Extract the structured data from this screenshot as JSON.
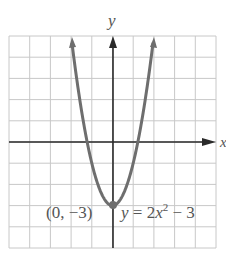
{
  "chart_data": {
    "type": "line",
    "title": "",
    "xlabel": "x",
    "ylabel": "y",
    "xlim": [
      -5,
      5
    ],
    "ylim": [
      -5,
      5
    ],
    "grid": true,
    "grid_step": 1,
    "series": [
      {
        "name": "y = 2x^2 - 3",
        "equation": "y = 2x^2 - 3",
        "x": [
          -2,
          -1.5,
          -1,
          -0.5,
          0,
          0.5,
          1,
          1.5,
          2
        ],
        "y": [
          5,
          1.5,
          -1,
          -2.5,
          -3,
          -2.5,
          -1,
          1.5,
          5
        ],
        "color": "#6e6e6e"
      }
    ],
    "annotations": [
      {
        "text": "(0, −3)",
        "point": [
          0,
          -3
        ],
        "type": "vertex"
      },
      {
        "text": "y = 2x² − 3",
        "type": "equation-label"
      }
    ]
  },
  "labels": {
    "x_axis": "x",
    "y_axis": "y",
    "vertex": "(0, −3)",
    "eq_y": "y",
    "eq_eq": " = 2",
    "eq_x": "x",
    "eq_exp": "2",
    "eq_tail": " − 3"
  },
  "colors": {
    "grid": "#c8c8c8",
    "axis": "#2a2a2a",
    "curve": "#6e6e6e",
    "text": "#555555"
  }
}
